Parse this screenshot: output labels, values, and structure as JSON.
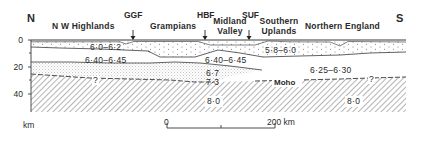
{
  "figure": {
    "type": "crustal cross-section",
    "direction_left": "N",
    "direction_right": "S"
  },
  "regions": [
    {
      "label": "N W Highlands"
    },
    {
      "label": "Grampians"
    },
    {
      "label": "Midland Valley",
      "line1": "Midland",
      "line2": "Valley"
    },
    {
      "label": "Southern Uplands",
      "line1": "Southern",
      "line2": "Uplands"
    },
    {
      "label": "Northern England"
    }
  ],
  "faults": [
    {
      "label": "GGF"
    },
    {
      "label": "HBF"
    },
    {
      "label": "SUF"
    }
  ],
  "depth_axis": {
    "unit": "km",
    "ticks": [
      "0",
      "20",
      "40"
    ]
  },
  "velocities": {
    "upper_north": "6·0–6·2",
    "upper_south": "5·8–6·0",
    "middle_north": "6·40–6·45",
    "middle_central": "6·40–6·45",
    "lower_a": "6·7",
    "lower_b": "7·3",
    "middle_south": "6·25–6·30",
    "mantle_central": "8·0",
    "mantle_south": "8·0"
  },
  "annotations": {
    "moho": "Moho",
    "uncertain_1": "?",
    "uncertain_2": "?"
  },
  "scale_bar": {
    "start": "0",
    "end": "200 km"
  },
  "colors": {
    "line": "#3a3a3a",
    "hatch": "#555555",
    "stipple": "#9a9a9a",
    "background": "#ffffff"
  }
}
